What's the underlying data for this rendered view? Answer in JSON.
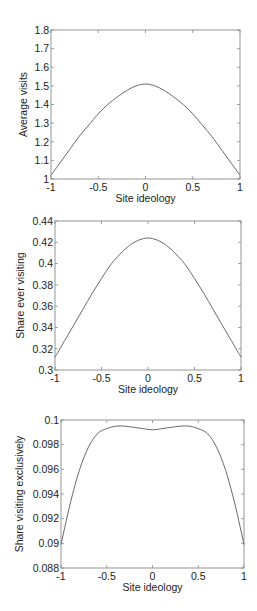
{
  "chart_data": [
    {
      "type": "line",
      "title": "",
      "xlabel": "Site ideology",
      "ylabel": "Average visits",
      "xlim": [
        -1,
        1
      ],
      "ylim": [
        1,
        1.8
      ],
      "xticks": [
        -1,
        -0.5,
        0,
        0.5,
        1
      ],
      "xtick_labels": [
        "-1",
        "-0.5",
        "0",
        "0.5",
        "1"
      ],
      "yticks": [
        1,
        1.1,
        1.2,
        1.3,
        1.4,
        1.5,
        1.6,
        1.7,
        1.8
      ],
      "ytick_labels": [
        "1",
        "1.1",
        "1.2",
        "1.3",
        "1.4",
        "1.5",
        "1.6",
        "1.7",
        "1.8"
      ],
      "grid": false,
      "series": [
        {
          "name": "Average visits",
          "x": [
            -1,
            -0.9,
            -0.8,
            -0.7,
            -0.6,
            -0.5,
            -0.4,
            -0.3,
            -0.2,
            -0.1,
            0,
            0.1,
            0.2,
            0.3,
            0.4,
            0.5,
            0.6,
            0.7,
            0.8,
            0.9,
            1
          ],
          "values": [
            1.02,
            1.09,
            1.16,
            1.23,
            1.29,
            1.35,
            1.4,
            1.44,
            1.475,
            1.5,
            1.51,
            1.5,
            1.475,
            1.44,
            1.4,
            1.35,
            1.29,
            1.23,
            1.16,
            1.09,
            1.02
          ]
        }
      ]
    },
    {
      "type": "line",
      "title": "",
      "xlabel": "Site ideology",
      "ylabel": "Share ever visiting",
      "xlim": [
        -1,
        1
      ],
      "ylim": [
        0.3,
        0.44
      ],
      "xticks": [
        -1,
        -0.5,
        0,
        0.5,
        1
      ],
      "xtick_labels": [
        "-1",
        "-0.5",
        "0",
        "0.5",
        "1"
      ],
      "yticks": [
        0.3,
        0.32,
        0.34,
        0.36,
        0.38,
        0.4,
        0.42,
        0.44
      ],
      "ytick_labels": [
        "0.3",
        "0.32",
        "0.34",
        "0.36",
        "0.38",
        "0.4",
        "0.42",
        "0.44"
      ],
      "grid": false,
      "series": [
        {
          "name": "Share ever visiting",
          "x": [
            -1,
            -0.9,
            -0.8,
            -0.7,
            -0.6,
            -0.5,
            -0.4,
            -0.3,
            -0.2,
            -0.1,
            0,
            0.1,
            0.2,
            0.3,
            0.4,
            0.5,
            0.6,
            0.7,
            0.8,
            0.9,
            1
          ],
          "values": [
            0.312,
            0.327,
            0.342,
            0.357,
            0.372,
            0.386,
            0.399,
            0.409,
            0.417,
            0.422,
            0.424,
            0.422,
            0.417,
            0.409,
            0.399,
            0.386,
            0.372,
            0.357,
            0.342,
            0.327,
            0.312
          ]
        }
      ]
    },
    {
      "type": "line",
      "title": "",
      "xlabel": "Site ideology",
      "ylabel": "Share visiting exclusively",
      "xlim": [
        -1,
        1
      ],
      "ylim": [
        0.088,
        0.1
      ],
      "xticks": [
        -1,
        -0.5,
        0,
        0.5,
        1
      ],
      "xtick_labels": [
        "-1",
        "-0.5",
        "0",
        "0.5",
        "1"
      ],
      "yticks": [
        0.088,
        0.09,
        0.092,
        0.094,
        0.096,
        0.098,
        0.1
      ],
      "ytick_labels": [
        "0.088",
        "0.09",
        "0.092",
        "0.094",
        "0.096",
        "0.098",
        "0.1"
      ],
      "grid": false,
      "series": [
        {
          "name": "Share visiting exclusively",
          "x": [
            -1,
            -0.9,
            -0.8,
            -0.7,
            -0.6,
            -0.5,
            -0.4,
            -0.3,
            -0.2,
            -0.1,
            0,
            0.1,
            0.2,
            0.3,
            0.4,
            0.5,
            0.6,
            0.7,
            0.8,
            0.9,
            1
          ],
          "values": [
            0.0899,
            0.0932,
            0.0959,
            0.0978,
            0.0989,
            0.0993,
            0.0995,
            0.0995,
            0.0994,
            0.0993,
            0.0992,
            0.0993,
            0.0994,
            0.0995,
            0.0995,
            0.0993,
            0.0989,
            0.0978,
            0.0959,
            0.0932,
            0.0899
          ]
        }
      ]
    }
  ]
}
